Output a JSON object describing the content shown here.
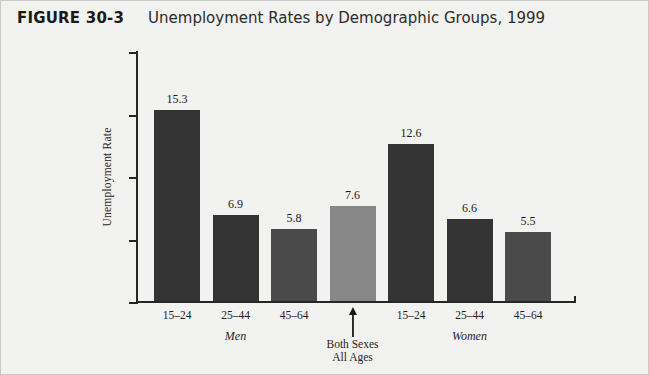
{
  "figure": {
    "label": "FIGURE 30-3",
    "title": "Unemployment Rates by Demographic Groups, 1999"
  },
  "annotation": {
    "caption_line1": "Both Sexes",
    "caption_line2": "All Ages",
    "arrow": "up-arrow-icon"
  },
  "colors": {
    "bar_dark": "#333333",
    "bar_medium": "#4a4a4a",
    "bar_highlight": "#878787",
    "axis": "#262626",
    "background": "#f2f2f0"
  },
  "chart_data": {
    "type": "bar",
    "title": "Unemployment Rates by Demographic Groups, 1999",
    "xlabel": "",
    "ylabel": "Unemployment Rate",
    "ylim": [
      0,
      20
    ],
    "yticks": [
      0,
      5,
      10,
      15,
      20
    ],
    "grid": false,
    "legend": false,
    "categories": [
      "15–24",
      "25–44",
      "45–64",
      "",
      "15–24",
      "25–44",
      "45–64"
    ],
    "values": [
      15.3,
      6.9,
      5.8,
      7.6,
      12.6,
      6.6,
      5.5
    ],
    "bar_colors": [
      "#333333",
      "#333333",
      "#4a4a4a",
      "#878787",
      "#333333",
      "#333333",
      "#4a4a4a"
    ],
    "groups": [
      {
        "label": "Men",
        "categories": [
          "15–24",
          "25–44",
          "45–64"
        ]
      },
      {
        "label": "Both Sexes All Ages",
        "categories": [
          ""
        ]
      },
      {
        "label": "Women",
        "categories": [
          "15–24",
          "25–44",
          "45–64"
        ]
      }
    ],
    "bars": [
      {
        "category": "15–24",
        "group": "Men",
        "value": 15.3,
        "label": "15.3",
        "color": "#333333"
      },
      {
        "category": "25–44",
        "group": "Men",
        "value": 6.9,
        "label": "6.9",
        "color": "#333333"
      },
      {
        "category": "45–64",
        "group": "Men",
        "value": 5.8,
        "label": "5.8",
        "color": "#4a4a4a"
      },
      {
        "category": "",
        "group": "Both Sexes All Ages",
        "value": 7.6,
        "label": "7.6",
        "color": "#878787"
      },
      {
        "category": "15–24",
        "group": "Women",
        "value": 12.6,
        "label": "12.6",
        "color": "#333333"
      },
      {
        "category": "25–44",
        "group": "Women",
        "value": 6.6,
        "label": "6.6",
        "color": "#333333"
      },
      {
        "category": "45–64",
        "group": "Women",
        "value": 5.5,
        "label": "5.5",
        "color": "#4a4a4a"
      }
    ]
  }
}
